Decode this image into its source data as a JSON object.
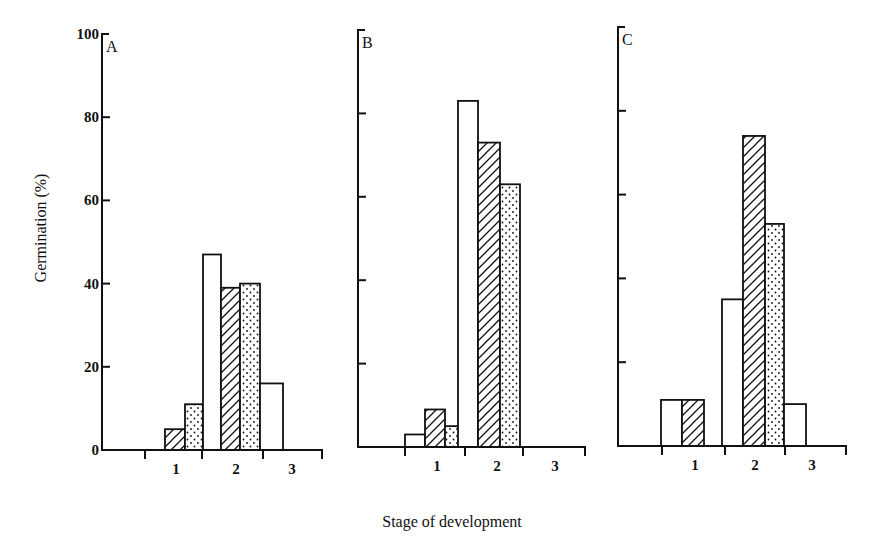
{
  "chart_data": {
    "type": "bar",
    "title": "",
    "xlabel": "Stage of development",
    "ylabel": "Germination (%)",
    "ylim": [
      0,
      100
    ],
    "yticks": [
      0,
      20,
      40,
      60,
      80,
      100
    ],
    "categories": [
      "1",
      "2",
      "3"
    ],
    "grid": false,
    "legend": null,
    "series_patterns": [
      "open",
      "hatched",
      "dotted"
    ],
    "panels": [
      {
        "label": "A",
        "bars": [
          {
            "stage_group": "1",
            "pattern": "hatched",
            "value": 5
          },
          {
            "stage_group": "1",
            "pattern": "dotted",
            "value": 11
          },
          {
            "stage_group": "1-2",
            "pattern": "open",
            "value": 47
          },
          {
            "stage_group": "2",
            "pattern": "hatched",
            "value": 39
          },
          {
            "stage_group": "2",
            "pattern": "dotted",
            "value": 40
          },
          {
            "stage_group": "2-3",
            "pattern": "open",
            "value": 16
          }
        ]
      },
      {
        "label": "B",
        "bars": [
          {
            "stage_group": "1",
            "pattern": "open",
            "value": 3
          },
          {
            "stage_group": "1",
            "pattern": "hatched",
            "value": 9
          },
          {
            "stage_group": "1",
            "pattern": "dotted",
            "value": 5
          },
          {
            "stage_group": "1-2",
            "pattern": "open",
            "value": 83
          },
          {
            "stage_group": "2",
            "pattern": "hatched",
            "value": 73
          },
          {
            "stage_group": "2",
            "pattern": "dotted",
            "value": 63
          }
        ]
      },
      {
        "label": "C",
        "bars": [
          {
            "stage_group": "1",
            "pattern": "open",
            "value": 11
          },
          {
            "stage_group": "1",
            "pattern": "hatched",
            "value": 11
          },
          {
            "stage_group": "1-2",
            "pattern": "open",
            "value": 35
          },
          {
            "stage_group": "2",
            "pattern": "hatched",
            "value": 74
          },
          {
            "stage_group": "2",
            "pattern": "dotted",
            "value": 53
          },
          {
            "stage_group": "2-3",
            "pattern": "open",
            "value": 10
          }
        ]
      }
    ]
  },
  "colors": {
    "ink": "#111111",
    "background": "#ffffff"
  }
}
